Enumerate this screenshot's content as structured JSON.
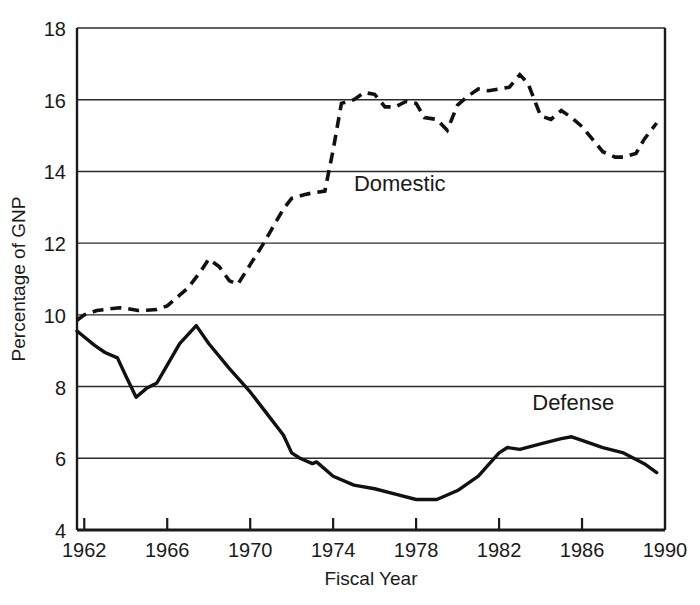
{
  "chart_data": {
    "type": "line",
    "title": "",
    "xlabel": "Fiscal Year",
    "ylabel": "Percentage of GNP",
    "xlim": [
      1961.65,
      1990
    ],
    "ylim": [
      4,
      18
    ],
    "grid": "horizontal",
    "legend_position": "inline-annotations",
    "x_ticks": [
      1962,
      1966,
      1970,
      1974,
      1978,
      1982,
      1986,
      1990
    ],
    "x_tick_labels": [
      "1962",
      "1966",
      "1970",
      "1974",
      "1978",
      "1982",
      "1986",
      "1990"
    ],
    "y_ticks": [
      4,
      6,
      8,
      10,
      12,
      14,
      16,
      18
    ],
    "y_tick_labels": [
      "4",
      "6",
      "8",
      "10",
      "12",
      "14",
      "16",
      "18"
    ],
    "gridline_values": [
      6,
      8,
      10,
      12,
      14,
      16,
      18
    ],
    "x": [
      1961.65,
      1962,
      1963,
      1964,
      1965,
      1966,
      1967,
      1968,
      1969,
      1970,
      1971,
      1972,
      1973,
      1974,
      1975,
      1976,
      1977,
      1978,
      1979,
      1980,
      1981,
      1982,
      1983,
      1984,
      1985,
      1986,
      1987,
      1988,
      1989,
      1989.6
    ],
    "series": [
      {
        "name": "Domestic",
        "style": "dashed",
        "color": "#111111",
        "label_x": 1975.0,
        "label_y": 13.45,
        "values": [
          9.85,
          10.0,
          10.15,
          10.2,
          10.15,
          10.2,
          10.6,
          11.05,
          11.55,
          11.25,
          11.95,
          12.65,
          13.3,
          13.4,
          15.95,
          16.15,
          15.9,
          15.8,
          15.45,
          15.15,
          15.8,
          16.3,
          16.35,
          16.25,
          16.45,
          16.7,
          15.6,
          15.4,
          15.15,
          14.9
        ]
      },
      {
        "name": "Defense",
        "style": "solid",
        "color": "#111111",
        "label_x": 1983.6,
        "label_y": 7.35,
        "values": [
          9.55,
          9.35,
          8.95,
          8.85,
          7.7,
          8.1,
          9.0,
          9.7,
          9.3,
          8.7,
          8.1,
          7.5,
          7.0,
          6.45,
          6.1,
          5.85,
          5.95,
          5.7,
          5.35,
          5.05,
          4.85,
          4.85,
          5.0,
          5.3,
          5.7,
          6.2,
          6.3,
          6.25,
          6.4,
          6.5
        ]
      }
    ],
    "domestic_points": [
      [
        1961.65,
        9.85
      ],
      [
        1962.0,
        10.0
      ],
      [
        1962.6,
        10.12
      ],
      [
        1963.0,
        10.15
      ],
      [
        1963.7,
        10.2
      ],
      [
        1964.0,
        10.18
      ],
      [
        1964.6,
        10.12
      ],
      [
        1965.0,
        10.13
      ],
      [
        1965.5,
        10.15
      ],
      [
        1966.0,
        10.25
      ],
      [
        1966.6,
        10.55
      ],
      [
        1967.0,
        10.75
      ],
      [
        1967.6,
        11.2
      ],
      [
        1968.0,
        11.55
      ],
      [
        1968.5,
        11.35
      ],
      [
        1969.0,
        10.95
      ],
      [
        1969.4,
        10.85
      ],
      [
        1970.0,
        11.4
      ],
      [
        1970.6,
        11.95
      ],
      [
        1971.0,
        12.35
      ],
      [
        1971.6,
        12.95
      ],
      [
        1972.0,
        13.25
      ],
      [
        1972.6,
        13.35
      ],
      [
        1973.0,
        13.4
      ],
      [
        1973.6,
        13.45
      ],
      [
        1974.0,
        14.6
      ],
      [
        1974.4,
        15.9
      ],
      [
        1975.0,
        16.0
      ],
      [
        1975.5,
        16.2
      ],
      [
        1976.0,
        16.15
      ],
      [
        1976.5,
        15.8
      ],
      [
        1977.0,
        15.8
      ],
      [
        1977.5,
        15.95
      ],
      [
        1978.0,
        15.9
      ],
      [
        1978.4,
        15.5
      ],
      [
        1979.0,
        15.45
      ],
      [
        1979.5,
        15.15
      ],
      [
        1980.0,
        15.85
      ],
      [
        1980.5,
        16.1
      ],
      [
        1981.0,
        16.3
      ],
      [
        1981.5,
        16.25
      ],
      [
        1982.0,
        16.3
      ],
      [
        1982.5,
        16.35
      ],
      [
        1983.0,
        16.7
      ],
      [
        1983.4,
        16.45
      ],
      [
        1984.0,
        15.55
      ],
      [
        1984.5,
        15.45
      ],
      [
        1985.0,
        15.7
      ],
      [
        1985.5,
        15.5
      ],
      [
        1986.0,
        15.25
      ],
      [
        1986.5,
        14.9
      ],
      [
        1987.0,
        14.55
      ],
      [
        1987.6,
        14.4
      ],
      [
        1988.0,
        14.4
      ],
      [
        1988.6,
        14.5
      ],
      [
        1989.0,
        14.9
      ],
      [
        1989.6,
        15.35
      ]
    ],
    "defense_points": [
      [
        1961.65,
        9.55
      ],
      [
        1962.5,
        9.15
      ],
      [
        1963.0,
        8.95
      ],
      [
        1963.6,
        8.8
      ],
      [
        1964.0,
        8.3
      ],
      [
        1964.5,
        7.7
      ],
      [
        1965.0,
        7.95
      ],
      [
        1965.5,
        8.1
      ],
      [
        1966.0,
        8.6
      ],
      [
        1966.6,
        9.2
      ],
      [
        1967.0,
        9.45
      ],
      [
        1967.4,
        9.7
      ],
      [
        1968.0,
        9.2
      ],
      [
        1969.0,
        8.5
      ],
      [
        1970.0,
        7.85
      ],
      [
        1971.0,
        7.1
      ],
      [
        1971.6,
        6.65
      ],
      [
        1972.0,
        6.15
      ],
      [
        1972.4,
        6.0
      ],
      [
        1973.0,
        5.85
      ],
      [
        1973.2,
        5.9
      ],
      [
        1974.0,
        5.5
      ],
      [
        1975.0,
        5.25
      ],
      [
        1976.0,
        5.15
      ],
      [
        1977.0,
        5.0
      ],
      [
        1978.0,
        4.85
      ],
      [
        1979.0,
        4.85
      ],
      [
        1980.0,
        5.1
      ],
      [
        1981.0,
        5.5
      ],
      [
        1982.0,
        6.15
      ],
      [
        1982.4,
        6.3
      ],
      [
        1983.0,
        6.25
      ],
      [
        1984.0,
        6.4
      ],
      [
        1985.0,
        6.55
      ],
      [
        1985.5,
        6.6
      ],
      [
        1986.0,
        6.5
      ],
      [
        1987.0,
        6.3
      ],
      [
        1988.0,
        6.15
      ],
      [
        1989.0,
        5.85
      ],
      [
        1989.6,
        5.6
      ]
    ]
  }
}
